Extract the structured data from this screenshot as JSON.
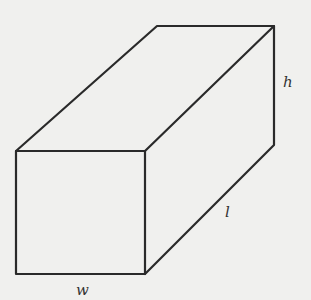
{
  "diagram": {
    "type": "rectangular-prism",
    "labels": {
      "height": "h",
      "length": "l",
      "width": "w"
    },
    "colors": {
      "background": "#f0f0ee",
      "stroke": "#2a2a2a",
      "label": "#333333"
    }
  }
}
